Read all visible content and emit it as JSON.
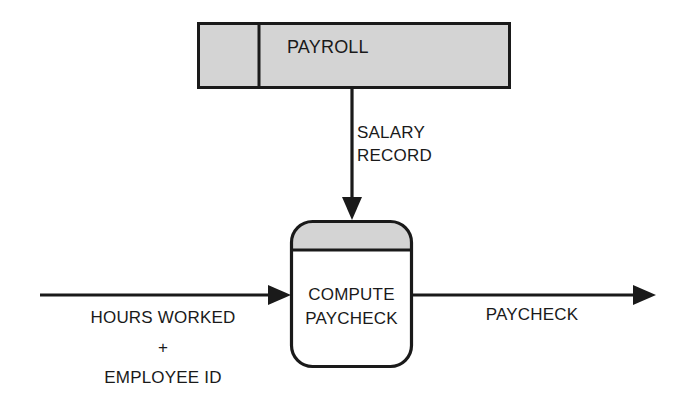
{
  "diagram": {
    "type": "data-flow-diagram",
    "background_color": "#ffffff",
    "line_color": "#1a1a1a",
    "fill_gray": "#d4d4d4",
    "data_store": {
      "name": "PAYROLL",
      "shape": "open-ended-rectangle-with-id-compartment",
      "fill": "#d4d4d4"
    },
    "process": {
      "name_line1": "COMPUTE",
      "name_line2": "PAYCHECK",
      "shape": "rounded-rectangle-with-header-band",
      "header_fill": "#d4d4d4",
      "body_fill": "#ffffff"
    },
    "flows": {
      "salary_record_line1": "SALARY",
      "salary_record_line2": "RECORD",
      "input_line1": "HOURS WORKED",
      "input_line2": "+",
      "input_line3": "EMPLOYEE ID",
      "output": "PAYCHECK"
    }
  }
}
